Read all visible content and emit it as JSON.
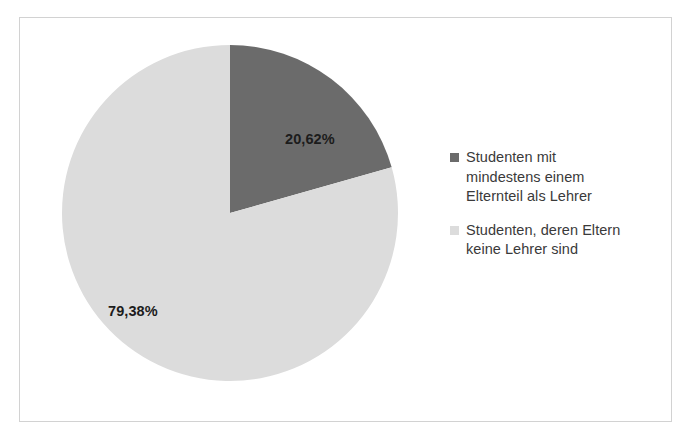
{
  "chart_data": {
    "type": "pie",
    "title": "",
    "subtitle": "",
    "xlabel": "",
    "ylabel": "",
    "grid": false,
    "legend_position": "right",
    "decimal_separator": ",",
    "start_angle_deg": 0,
    "direction": "clockwise",
    "categories": [
      "Studenten mit mindestens einem Elternteil als Lehrer",
      "Studenten, deren Eltern keine Lehrer sind"
    ],
    "values": [
      20.62,
      79.38
    ],
    "value_labels": [
      "20,62%",
      "79,38%"
    ],
    "colors": [
      "#6b6b6b",
      "#dcdcdc"
    ],
    "slices": [
      {
        "label": "Studenten mit mindestens einem Elternteil als Lehrer",
        "legend_lines": [
          "Studenten mit",
          "mindestens einem",
          "Elternteil als Lehrer"
        ],
        "value": 20.62,
        "value_label": "20,62%",
        "color": "#6b6b6b",
        "sweep_deg": 74.23
      },
      {
        "label": "Studenten, deren Eltern keine Lehrer sind",
        "legend_lines": [
          "Studenten, deren Eltern",
          "keine Lehrer sind"
        ],
        "value": 79.38,
        "value_label": "79,38%",
        "color": "#dcdcdc",
        "sweep_deg": 285.77
      }
    ]
  },
  "frame": {
    "border_color": "#d2d2d2",
    "background": "#ffffff"
  },
  "legend": {
    "entries": [
      {
        "text": "Studenten mit mindestens einem Elternteil als Lehrer",
        "color": "#6b6b6b"
      },
      {
        "text": "Studenten, deren Eltern keine Lehrer sind",
        "color": "#dcdcdc"
      }
    ]
  }
}
